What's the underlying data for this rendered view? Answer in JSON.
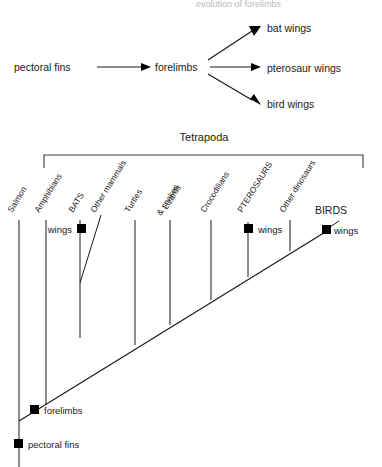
{
  "figure": {
    "title_cut_off": "evolution of forelimbs",
    "flow_diagram": {
      "nodes": [
        {
          "id": "pectoral-fins",
          "label": "pectoral  fins",
          "x": 14,
          "y": 67
        },
        {
          "id": "forelimbs",
          "label": "forelimbs",
          "x": 155,
          "y": 67
        },
        {
          "id": "bat-wings",
          "label": "bat  wings",
          "x": 267,
          "y": 28
        },
        {
          "id": "pterosaur-wings",
          "label": "pterosaur wings",
          "x": 267,
          "y": 69
        },
        {
          "id": "bird-wings",
          "label": "bird  wings",
          "x": 267,
          "y": 105
        }
      ],
      "arrows": [
        {
          "from": "pectoral-fins",
          "to": "forelimbs"
        },
        {
          "from": "forelimbs",
          "to": "bat-wings"
        },
        {
          "from": "forelimbs",
          "to": "pterosaur-wings"
        },
        {
          "from": "forelimbs",
          "to": "bird-wings"
        }
      ]
    },
    "cladogram": {
      "group_bracket_label": "Tetrapoda",
      "taxa": [
        {
          "name": "Salmon",
          "x": 19,
          "style": "normal"
        },
        {
          "name": "Amphibians",
          "x": 46,
          "style": "normal"
        },
        {
          "name": "BATS",
          "x": 80,
          "style": "caps"
        },
        {
          "name": "Other mammals",
          "x": 101,
          "style": "normal"
        },
        {
          "name": "Turtles",
          "x": 135,
          "style": "normal"
        },
        {
          "name": "Lizards\n& snakes",
          "x": 170,
          "style": "normal"
        },
        {
          "name": "Crocodilians",
          "x": 211,
          "style": "normal"
        },
        {
          "name": "PTEROSAURS",
          "x": 248,
          "style": "caps"
        },
        {
          "name": "Other dinosaurs",
          "x": 290,
          "style": "normal"
        },
        {
          "name": "BIRDS",
          "x": 330,
          "style": "caps"
        }
      ],
      "taxa_labels": [
        "Salmon",
        "Amphibians",
        "BATS",
        "Other mammals",
        "Turtles",
        "Lizards",
        "& snakes",
        "Crocodilians",
        "PTEROSAURS",
        "Other dinosaurs",
        "BIRDS"
      ],
      "character_marks": [
        {
          "id": "bats-wings",
          "label": "wings",
          "x": 82,
          "y": 229,
          "label_side": "left"
        },
        {
          "id": "pterosaurs-wings",
          "label": "wings",
          "x": 248,
          "y": 229,
          "label_side": "right"
        },
        {
          "id": "birds-wings",
          "label": "wings",
          "x": 327,
          "y": 230,
          "label_side": "right"
        },
        {
          "id": "forelimbs-node",
          "label": "forelimbs",
          "x": 33,
          "y": 409,
          "label_side": "right"
        },
        {
          "id": "pectoral-fins-node",
          "label": "pectoral  fins",
          "x": 18,
          "y": 444,
          "label_side": "right"
        }
      ]
    }
  }
}
